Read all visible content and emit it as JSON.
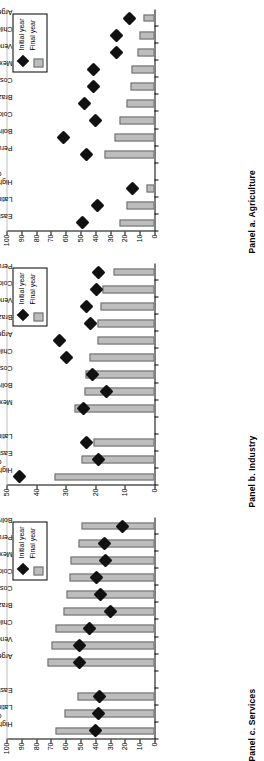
{
  "figure": {
    "legend": {
      "initial_label": "Initial year",
      "final_label": "Final year"
    },
    "colors": {
      "bar_fill": "#bdbdbd",
      "bar_stroke": "#6b6b6b",
      "marker": "#111111"
    }
  },
  "chart_data": [
    {
      "type": "bar",
      "panel_id": "panel-c",
      "title": "Panel c. Services",
      "xlabel": "",
      "ylabel": "",
      "ylim": [
        0,
        100
      ],
      "yticks": [
        0,
        10,
        20,
        30,
        40,
        50,
        60,
        70,
        80,
        90,
        100
      ],
      "grid": false,
      "legend_position": "top-right",
      "categories": [
        "High-income countries",
        "Latin America",
        "East Asia",
        "",
        "Argentina",
        "Venezuela",
        "Chile",
        "Brazil",
        "Costa Rica",
        "Colombia",
        "Mexico",
        "Peru",
        "Bolivia"
      ],
      "series": [
        {
          "name": "Final year",
          "kind": "bar",
          "values": [
            66.8,
            60.8,
            52.0,
            null,
            72.4,
            69.6,
            66.8,
            61.3,
            59.3,
            57.6,
            57.0,
            51.2,
            49.0
          ]
        },
        {
          "name": "Initial year",
          "kind": "diamond",
          "values": [
            39.6,
            37.8,
            37.2,
            null,
            50.4,
            50.7,
            43.6,
            29.9,
            36.6,
            39.2,
            33.3,
            34.0,
            21.3
          ]
        }
      ]
    },
    {
      "type": "bar",
      "panel_id": "panel-b",
      "title": "Panel b. Industry",
      "xlabel": "",
      "ylabel": "",
      "ylim": [
        0,
        50
      ],
      "yticks": [
        0,
        10,
        20,
        30,
        40,
        50
      ],
      "grid": false,
      "legend_position": "top-right",
      "categories": [
        "High-income countries",
        "East Asia",
        "Latin America",
        "",
        "Mexico",
        "Bolivia",
        "Costa Rica",
        "Chile",
        "Argentina",
        "Brazil",
        "Venezuela",
        "Colombia",
        "Peru"
      ],
      "series": [
        {
          "name": "Final year",
          "kind": "bar",
          "values": [
            33.8,
            24.6,
            20.7,
            null,
            26.9,
            23.6,
            23.3,
            21.9,
            19.4,
            19.2,
            18.3,
            17.5,
            13.8
          ]
        },
        {
          "name": "Initial year",
          "kind": "diamond",
          "values": [
            45.6,
            19.0,
            23.1,
            null,
            24.1,
            16.3,
            21.0,
            29.6,
            32.2,
            21.7,
            23.1,
            19.6,
            19.0
          ]
        }
      ]
    },
    {
      "type": "bar",
      "panel_id": "panel-a",
      "title": "Panel a. Agriculture",
      "xlabel": "",
      "ylabel": "",
      "ylim": [
        0,
        100
      ],
      "yticks": [
        0,
        10,
        20,
        30,
        40,
        50,
        60,
        70,
        80,
        90,
        100
      ],
      "grid": false,
      "legend_position": "top-right",
      "categories": [
        "East Asia",
        "Latin America",
        "High-income countries",
        "",
        "Peru",
        "Bolivia",
        "Colombia",
        "Brazil",
        "Costa Rica",
        "Mexico",
        "Venezuela",
        "Chile",
        "Argentina"
      ],
      "series": [
        {
          "name": "Final year",
          "kind": "bar",
          "values": [
            23.5,
            18.6,
            5.1,
            null,
            34.1,
            26.7,
            23.7,
            18.6,
            16.5,
            15.4,
            11.2,
            10.3,
            7.2
          ]
        },
        {
          "name": "Initial year",
          "kind": "diamond",
          "values": [
            48.4,
            38.7,
            14.7,
            null,
            45.8,
            61.2,
            40.1,
            47.6,
            41.3,
            41.2,
            25.4,
            25.8,
            16.7
          ]
        }
      ]
    }
  ]
}
